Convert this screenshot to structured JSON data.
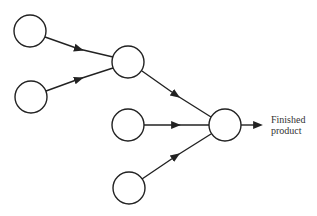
{
  "diagram": {
    "nodes": [
      {
        "id": "n1",
        "cx": 30,
        "cy": 31,
        "r": 16
      },
      {
        "id": "n2",
        "cx": 31,
        "cy": 97,
        "r": 16
      },
      {
        "id": "n3",
        "cx": 128,
        "cy": 62,
        "r": 16
      },
      {
        "id": "n4",
        "cx": 128,
        "cy": 125,
        "r": 16
      },
      {
        "id": "n5",
        "cx": 225,
        "cy": 125,
        "r": 16
      },
      {
        "id": "n6",
        "cx": 129,
        "cy": 188,
        "r": 16
      }
    ],
    "edges": [
      {
        "from": "n1",
        "to": "n3"
      },
      {
        "from": "n2",
        "to": "n3"
      },
      {
        "from": "n3",
        "to": "n5"
      },
      {
        "from": "n4",
        "to": "n5"
      },
      {
        "from": "n6",
        "to": "n5"
      },
      {
        "from": "n5",
        "to": "output"
      }
    ],
    "output_label_line1": "Finished",
    "output_label_line2": "product"
  }
}
